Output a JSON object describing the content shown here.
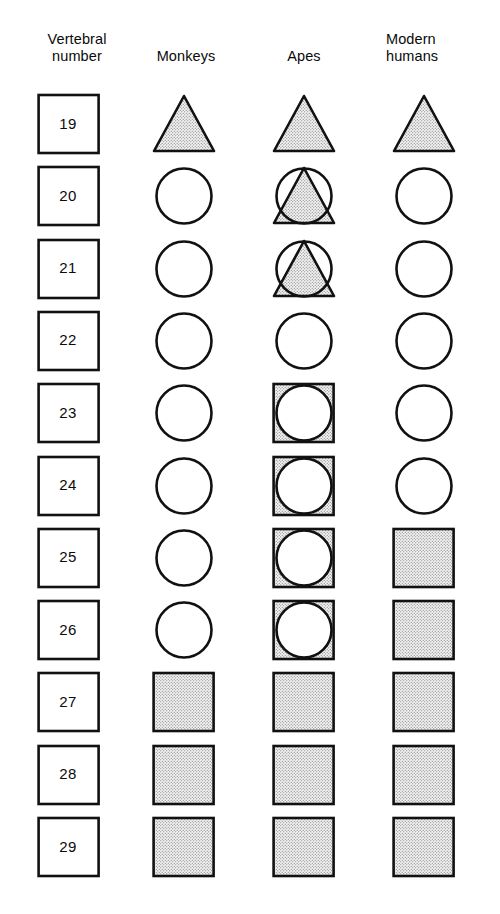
{
  "figure": {
    "title_columns": {
      "vertebral_number": "Vertebral\nnumber",
      "monkeys": "Monkeys",
      "apes": "Apes",
      "modern_humans": "Modern\nhumans"
    },
    "colors": {
      "outline": "#111111",
      "stipple_fill": "#e8e8e8",
      "stipple_dot": "#6f6f6f",
      "empty_fill": "#ffffff",
      "background": "#ffffff",
      "text": "#0a0a0a"
    },
    "legend_shapes": {
      "triangle": "stippled triangle",
      "circle": "open circle",
      "square": "stippled square",
      "circle_on_triangle": "open circle over stippled triangle",
      "circle_on_square": "open circle over stippled square",
      "numbox": "open square with vertebral number"
    },
    "rows": [
      {
        "number": "19",
        "monkeys": "triangle",
        "apes": "triangle",
        "modern_humans": "triangle"
      },
      {
        "number": "20",
        "monkeys": "circle",
        "apes": "circle_on_triangle",
        "modern_humans": "circle"
      },
      {
        "number": "21",
        "monkeys": "circle",
        "apes": "circle_on_triangle",
        "modern_humans": "circle"
      },
      {
        "number": "22",
        "monkeys": "circle",
        "apes": "circle",
        "modern_humans": "circle"
      },
      {
        "number": "23",
        "monkeys": "circle",
        "apes": "circle_on_square",
        "modern_humans": "circle"
      },
      {
        "number": "24",
        "monkeys": "circle",
        "apes": "circle_on_square",
        "modern_humans": "circle"
      },
      {
        "number": "25",
        "monkeys": "circle",
        "apes": "circle_on_square",
        "modern_humans": "square"
      },
      {
        "number": "26",
        "monkeys": "circle",
        "apes": "circle_on_square",
        "modern_humans": "square"
      },
      {
        "number": "27",
        "monkeys": "square",
        "apes": "square",
        "modern_humans": "square"
      },
      {
        "number": "28",
        "monkeys": "square",
        "apes": "square",
        "modern_humans": "square"
      },
      {
        "number": "29",
        "monkeys": "square",
        "apes": "square",
        "modern_humans": "square"
      }
    ]
  }
}
